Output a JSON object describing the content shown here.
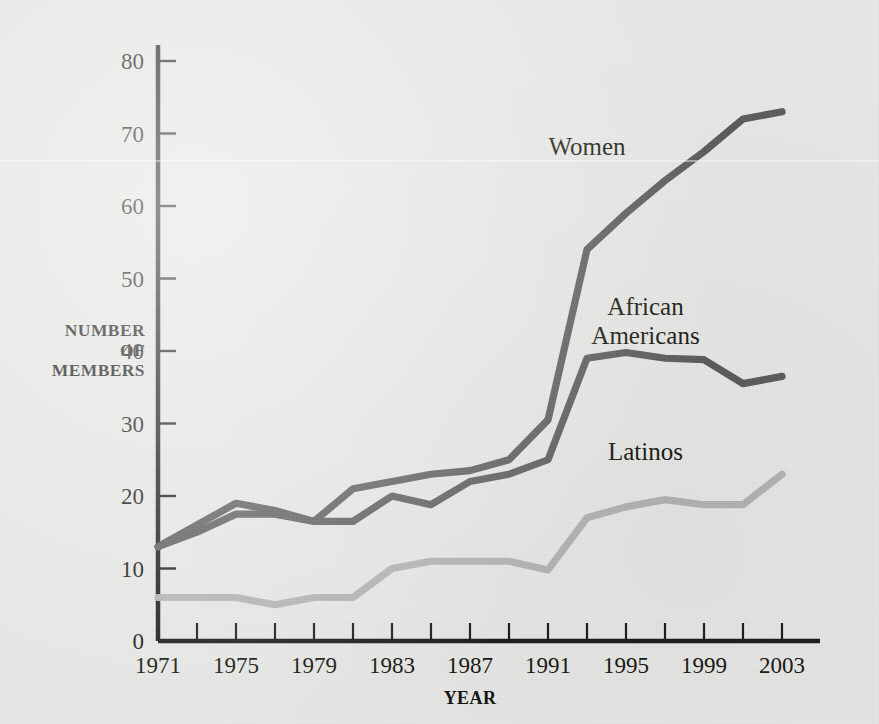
{
  "chart_data": {
    "type": "line",
    "title": "",
    "xlabel": "YEAR",
    "ylabel": "NUMBER OF MEMBERS",
    "ylabel_lines": [
      "NUMBER",
      "OF",
      "MEMBERS"
    ],
    "xlim": [
      1971,
      2003
    ],
    "ylim": [
      0,
      80
    ],
    "ytick_step": 10,
    "xtick_step_minor": 2,
    "xtick_step_major": 4,
    "grid": false,
    "legend_position": "inline-labels",
    "yticks": [
      0,
      10,
      20,
      30,
      40,
      50,
      60,
      70,
      80
    ],
    "xticks_major": [
      1971,
      1975,
      1979,
      1983,
      1987,
      1991,
      1995,
      1999,
      2003
    ],
    "xticks_minor": [
      1971,
      1973,
      1975,
      1977,
      1979,
      1981,
      1983,
      1985,
      1987,
      1989,
      1991,
      1993,
      1995,
      1997,
      1999,
      2001,
      2003
    ],
    "x": [
      1971,
      1973,
      1975,
      1977,
      1979,
      1981,
      1983,
      1985,
      1987,
      1989,
      1991,
      1993,
      1995,
      1997,
      1999,
      2001,
      2003
    ],
    "series": [
      {
        "name": "Women",
        "color": "#5b5b5b",
        "label_x": 1993,
        "label_y": 67,
        "values": [
          13,
          16,
          19,
          18,
          16.5,
          21,
          22,
          23,
          23.5,
          25,
          30.5,
          54,
          59,
          63.5,
          67.5,
          72,
          73
        ]
      },
      {
        "name": "African Americans",
        "color": "#5b5b5b",
        "label_x": 1996,
        "label_y": 45,
        "values": [
          13,
          15,
          17.5,
          17.5,
          16.5,
          16.5,
          20,
          18.8,
          22,
          23,
          25,
          39,
          39.8,
          39,
          38.8,
          35.5,
          36.5
        ]
      },
      {
        "name": "Latinos",
        "color": "#b4b4b4",
        "label_x": 1996,
        "label_y": 25,
        "values": [
          6,
          6,
          6,
          5,
          6,
          6,
          10,
          11,
          11,
          11,
          9.8,
          17,
          18.5,
          19.5,
          18.8,
          18.8,
          23
        ]
      }
    ]
  }
}
